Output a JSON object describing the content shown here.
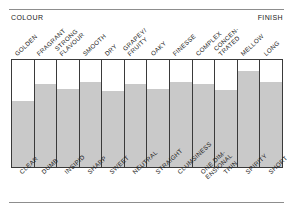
{
  "figure": {
    "corner_left_label": "COLOUR",
    "corner_right_label": "FINISH"
  },
  "chart_data": {
    "type": "bar",
    "title": "",
    "subtitle": "",
    "xlabel": "",
    "ylabel": "",
    "grid": false,
    "legend": "none",
    "ylim": [
      0,
      100
    ],
    "axis_left_caption": "COLOUR",
    "axis_right_caption": "FINISH",
    "categories_top": [
      "GOLDEN",
      "FRAGRANT",
      "STRONG FLAVOUR",
      "SMOOTH",
      "DRY",
      "GRAPEY/ FRUITY",
      "OAKY",
      "FINESSE",
      "COMPLEX",
      "CONCEN- TRATED",
      "MELLOW",
      "LONG"
    ],
    "categories_bottom": [
      "CLEAR",
      "DUMB",
      "INSIPID",
      "SHARP",
      "SWEET",
      "NEUTRAL",
      "STRAIGHT",
      "CLUMSINESS",
      "ONE DIM- ENSIONAL",
      "THIN",
      "SPIRITY",
      "SHORT"
    ],
    "values": [
      62,
      78,
      73,
      79,
      71,
      78,
      73,
      79,
      78,
      72,
      90,
      79
    ],
    "bar_color": "#c9c9c9",
    "frame_color": "#3a3a3a"
  },
  "top_labels": [
    {
      "line1": "GOLDEN",
      "line2": ""
    },
    {
      "line1": "FRAGRANT",
      "line2": ""
    },
    {
      "line1": "STRONG",
      "line2": "FLAVOUR"
    },
    {
      "line1": "SMOOTH",
      "line2": ""
    },
    {
      "line1": "DRY",
      "line2": ""
    },
    {
      "line1": "GRAPEY/",
      "line2": "FRUITY"
    },
    {
      "line1": "OAKY",
      "line2": ""
    },
    {
      "line1": "FINESSE",
      "line2": ""
    },
    {
      "line1": "COMPLEX",
      "line2": ""
    },
    {
      "line1": "CONCEN-",
      "line2": "TRATED"
    },
    {
      "line1": "MELLOW",
      "line2": ""
    },
    {
      "line1": "LONG",
      "line2": ""
    }
  ],
  "bottom_labels": [
    {
      "line1": "CLEAR",
      "line2": ""
    },
    {
      "line1": "DUMB",
      "line2": ""
    },
    {
      "line1": "INSIPID",
      "line2": ""
    },
    {
      "line1": "SHARP",
      "line2": ""
    },
    {
      "line1": "SWEET",
      "line2": ""
    },
    {
      "line1": "NEUTRAL",
      "line2": ""
    },
    {
      "line1": "STRAIGHT",
      "line2": ""
    },
    {
      "line1": "CLUMSINESS",
      "line2": ""
    },
    {
      "line1": "ONE DIM-",
      "line2": "ENSIONAL"
    },
    {
      "line1": "THIN",
      "line2": ""
    },
    {
      "line1": "SPIRITY",
      "line2": ""
    },
    {
      "line1": "SHORT",
      "line2": ""
    }
  ]
}
